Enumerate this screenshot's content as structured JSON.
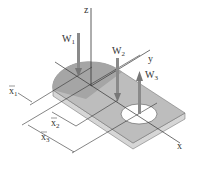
{
  "diagram": {
    "axes": {
      "x_label": "x",
      "y_label": "y",
      "z_label": "z"
    },
    "forces": [
      {
        "name": "W",
        "sub": "1",
        "direction": "down"
      },
      {
        "name": "W",
        "sub": "2",
        "direction": "down"
      },
      {
        "name": "W",
        "sub": "3",
        "direction": "up"
      }
    ],
    "dimensions": [
      {
        "name": "x",
        "sub": "1",
        "bar": true
      },
      {
        "name": "x",
        "sub": "2",
        "bar": true
      },
      {
        "name": "x",
        "sub": "3",
        "bar": true
      }
    ],
    "colors": {
      "plate_top": "#bdbdbd",
      "plate_half_disc": "#a5a5a5",
      "plate_edge": "#d6d6d6",
      "arrow": "#8a8a8a",
      "line": "#333333"
    }
  }
}
